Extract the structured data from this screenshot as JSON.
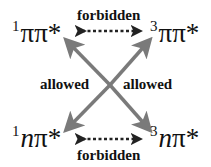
{
  "diagram": {
    "states": {
      "singlet_pipi": {
        "multiplicity": "1",
        "label": "ππ*"
      },
      "triplet_pipi": {
        "multiplicity": "3",
        "label": "ππ*"
      },
      "singlet_npi": {
        "multiplicity": "1",
        "orbital": "n",
        "label": "π*"
      },
      "triplet_npi": {
        "multiplicity": "3",
        "orbital": "n",
        "label": "π*"
      }
    },
    "transitions": {
      "top": "forbidden",
      "bottom": "forbidden",
      "left_cross": "allowed",
      "right_cross": "allowed"
    },
    "colors": {
      "allowed_arrow": "#7a7a7a",
      "forbidden_arrow": "#222222",
      "text": "#111111"
    }
  }
}
